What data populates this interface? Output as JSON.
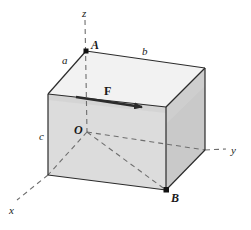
{
  "figure": {
    "background_color": "#ffffff",
    "stroke_color": "#2b2b2b",
    "dashed_color": "#6e6e6e",
    "face_colors": {
      "top": "#f2f2f2",
      "left_front": "#dcdcdc",
      "right_front": "#c9c9c9",
      "left_sliver": "#d2d2d2"
    },
    "force_arrow_color": "#2b2b2b",
    "point_marker_color": "#111111"
  },
  "axes": [
    {
      "name": "z-axis",
      "label": "z",
      "x": 82,
      "y": 8
    },
    {
      "name": "y-axis",
      "label": "y",
      "x": 231,
      "y": 145
    },
    {
      "name": "x-axis",
      "label": "x",
      "x": 9,
      "y": 205
    }
  ],
  "dimensions": [
    {
      "name": "edge-a",
      "label": "a",
      "x": 62,
      "y": 55
    },
    {
      "name": "edge-b",
      "label": "b",
      "x": 142,
      "y": 46
    },
    {
      "name": "edge-c",
      "label": "c",
      "x": 39,
      "y": 131
    }
  ],
  "points": [
    {
      "name": "point-A",
      "label": "A",
      "label_x": 91,
      "label_y": 39,
      "cx": 86,
      "cy": 51
    },
    {
      "name": "point-O",
      "label": "O",
      "label_x": 74,
      "label_y": 124,
      "cx": 87,
      "cy": 132
    },
    {
      "name": "point-B",
      "label": "B",
      "label_x": 171,
      "label_y": 192,
      "cx": 166,
      "cy": 190
    }
  ],
  "force": {
    "name": "force-vector",
    "label": "F",
    "label_x": 104,
    "label_y": 85,
    "start_x": 76,
    "start_y": 97,
    "end_x": 147,
    "end_y": 108
  },
  "geometry": {
    "vertices": {
      "top_back_left": {
        "x": 86,
        "y": 51
      },
      "top_front_left": {
        "x": 48,
        "y": 94
      },
      "top_front_right": {
        "x": 166,
        "y": 107
      },
      "top_back_right": {
        "x": 205,
        "y": 68
      },
      "bot_front_left": {
        "x": 48,
        "y": 175
      },
      "bot_front_right": {
        "x": 166,
        "y": 190
      },
      "bot_back_right": {
        "x": 205,
        "y": 150
      },
      "bot_back_left": {
        "x": 87,
        "y": 132
      }
    }
  }
}
